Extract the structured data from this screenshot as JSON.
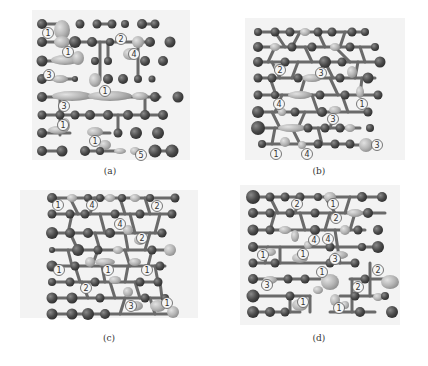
{
  "figure": {
    "colors": {
      "atom_dark": "#4a4a4a",
      "atom_light": "#b8b8b8",
      "bond": "#6a6a6a",
      "panel_bg": "#f3f3f3",
      "label_bg": "#f5f5f5",
      "label_fg": "#333333"
    },
    "panels": [
      {
        "id": "a",
        "caption": "(a)",
        "labels": [
          {
            "text": "①",
            "x": 48,
            "y": 33
          },
          {
            "text": "①",
            "x": 68,
            "y": 52
          },
          {
            "text": "②",
            "x": 121,
            "y": 39
          },
          {
            "text": "④",
            "x": 134,
            "y": 54
          },
          {
            "text": "③",
            "x": 49,
            "y": 75
          },
          {
            "text": "①",
            "x": 105,
            "y": 91
          },
          {
            "text": "③",
            "x": 64,
            "y": 106
          },
          {
            "text": "①",
            "x": 63,
            "y": 125
          },
          {
            "text": "①",
            "x": 95,
            "y": 141
          },
          {
            "text": "⑤",
            "x": 141,
            "y": 155
          }
        ]
      },
      {
        "id": "b",
        "caption": "(b)",
        "labels": [
          {
            "text": "②",
            "x": 280,
            "y": 70
          },
          {
            "text": "③",
            "x": 321,
            "y": 73
          },
          {
            "text": "④",
            "x": 279,
            "y": 104
          },
          {
            "text": "①",
            "x": 362,
            "y": 104
          },
          {
            "text": "③",
            "x": 333,
            "y": 119
          },
          {
            "text": "③",
            "x": 377,
            "y": 145
          },
          {
            "text": "①",
            "x": 276,
            "y": 154
          },
          {
            "text": "④",
            "x": 307,
            "y": 154
          }
        ]
      },
      {
        "id": "c",
        "caption": "(c)",
        "labels": [
          {
            "text": "①",
            "x": 58,
            "y": 205
          },
          {
            "text": "④",
            "x": 92,
            "y": 205
          },
          {
            "text": "②",
            "x": 157,
            "y": 206
          },
          {
            "text": "④",
            "x": 120,
            "y": 224
          },
          {
            "text": "②",
            "x": 142,
            "y": 238
          },
          {
            "text": "①",
            "x": 59,
            "y": 270
          },
          {
            "text": "①",
            "x": 108,
            "y": 270
          },
          {
            "text": "①",
            "x": 147,
            "y": 270
          },
          {
            "text": "②",
            "x": 86,
            "y": 288
          },
          {
            "text": "③",
            "x": 131,
            "y": 306
          },
          {
            "text": "①",
            "x": 167,
            "y": 303
          }
        ]
      },
      {
        "id": "d",
        "caption": "(d)",
        "labels": [
          {
            "text": "②",
            "x": 297,
            "y": 204
          },
          {
            "text": "①",
            "x": 333,
            "y": 204
          },
          {
            "text": "②",
            "x": 336,
            "y": 218
          },
          {
            "text": "④",
            "x": 314,
            "y": 240
          },
          {
            "text": "④",
            "x": 328,
            "y": 239
          },
          {
            "text": "①",
            "x": 263,
            "y": 255
          },
          {
            "text": "①",
            "x": 303,
            "y": 254
          },
          {
            "text": "③",
            "x": 335,
            "y": 259
          },
          {
            "text": "①",
            "x": 322,
            "y": 272
          },
          {
            "text": "②",
            "x": 378,
            "y": 270
          },
          {
            "text": "③",
            "x": 267,
            "y": 285
          },
          {
            "text": "②",
            "x": 358,
            "y": 287
          },
          {
            "text": "①",
            "x": 303,
            "y": 302
          },
          {
            "text": "①",
            "x": 339,
            "y": 308
          }
        ]
      }
    ]
  }
}
